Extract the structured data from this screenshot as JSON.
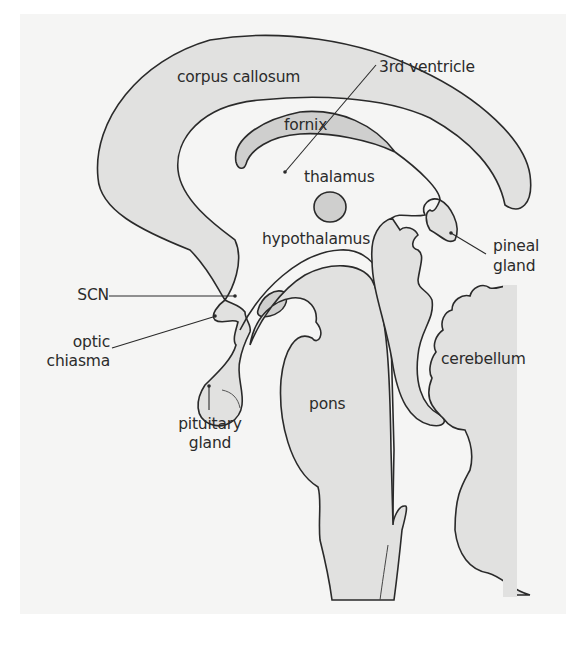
{
  "figure": {
    "colors": {
      "background": "#ffffff",
      "panel": "#f5f5f4",
      "tissue_fill": "#e1e1e0",
      "dark_fill": "#cfcfce",
      "outline": "#2a2a2a"
    }
  },
  "labels": {
    "corpus_callosum": "corpus callosum",
    "third_ventricle": "3rd ventricle",
    "fornix": "fornix",
    "thalamus": "thalamus",
    "hypothalamus": "hypothalamus",
    "pineal_gland_1": "pineal",
    "pineal_gland_2": "gland",
    "scn": "SCN",
    "optic_chiasma_1": "optic",
    "optic_chiasma_2": "chiasma",
    "cerebellum": "cerebellum",
    "pons": "pons",
    "pituitary_gland_1": "pituitary",
    "pituitary_gland_2": "gland"
  }
}
